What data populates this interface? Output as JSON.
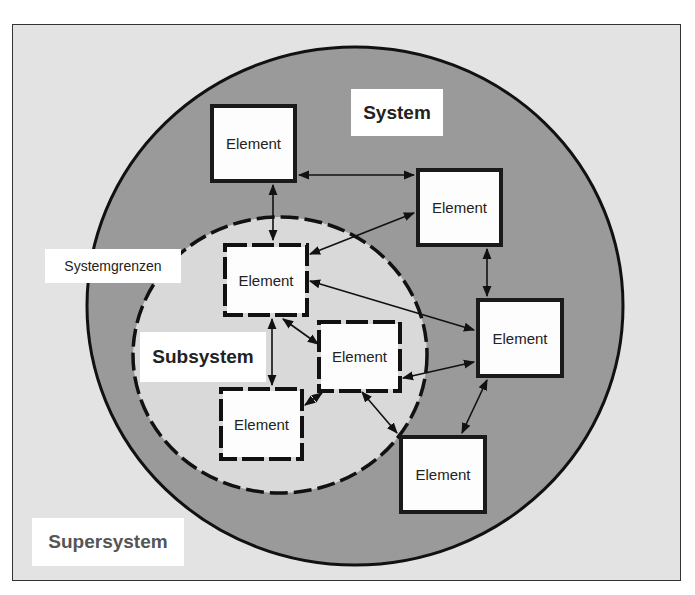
{
  "diagram": {
    "labels": {
      "system": "System",
      "subsystem": "Subsystem",
      "supersystem": "Supersystem",
      "boundaries": "Systemgrenzen"
    },
    "elements": [
      {
        "id": "sys-top-left",
        "label": "Element",
        "group": "system"
      },
      {
        "id": "sys-top-right",
        "label": "Element",
        "group": "system"
      },
      {
        "id": "sys-right",
        "label": "Element",
        "group": "system"
      },
      {
        "id": "sys-bottom-right",
        "label": "Element",
        "group": "system"
      },
      {
        "id": "sub-top",
        "label": "Element",
        "group": "subsystem"
      },
      {
        "id": "sub-middle",
        "label": "Element",
        "group": "subsystem"
      },
      {
        "id": "sub-bottom",
        "label": "Element",
        "group": "subsystem"
      }
    ],
    "connections": [
      [
        "sys-top-left",
        "sys-top-right"
      ],
      [
        "sys-top-left",
        "sub-top"
      ],
      [
        "sys-top-right",
        "sub-top"
      ],
      [
        "sys-top-right",
        "sys-right"
      ],
      [
        "sub-top",
        "sys-right"
      ],
      [
        "sub-top",
        "sub-middle"
      ],
      [
        "sub-top",
        "sub-bottom"
      ],
      [
        "sub-middle",
        "sys-right"
      ],
      [
        "sub-middle",
        "sub-bottom"
      ],
      [
        "sub-middle",
        "sys-bottom-right"
      ],
      [
        "sys-right",
        "sys-bottom-right"
      ]
    ],
    "colors": {
      "background": "#e3e3e3",
      "system_ring": "#9a9a9a",
      "subsystem_fill": "#d9d9d9",
      "element_fill": "#fdfdfd",
      "stroke": "#111111"
    }
  }
}
